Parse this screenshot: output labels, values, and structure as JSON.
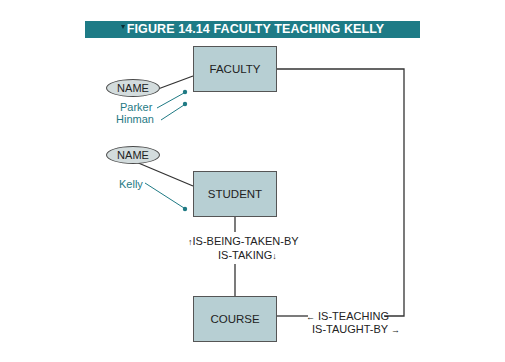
{
  "figure": {
    "title": "FIGURE 14.14 FACULTY TEACHING KELLY",
    "banner_color": "#1e7b86"
  },
  "entities": {
    "faculty": {
      "label": "FACULTY"
    },
    "student": {
      "label": "STUDENT"
    },
    "course": {
      "label": "COURSE"
    }
  },
  "attributes": {
    "faculty_name": {
      "label": "NAME",
      "values": [
        "Parker",
        "Hinman"
      ]
    },
    "student_name": {
      "label": "NAME",
      "values": [
        "Kelly"
      ]
    }
  },
  "relationships": {
    "student_course": {
      "forward": "IS-BEING-TAKEN-BY",
      "forward_arrow": "↑",
      "reverse": "IS-TAKING",
      "reverse_arrow": "↓"
    },
    "faculty_course": {
      "forward": "IS-TEACHING",
      "forward_arrow": "←",
      "reverse": "IS-TAUGHT-BY",
      "reverse_arrow": "→"
    }
  },
  "colors": {
    "entity_fill": "#b7cfd3",
    "value_text": "#1f7a84",
    "line": "#333333"
  }
}
